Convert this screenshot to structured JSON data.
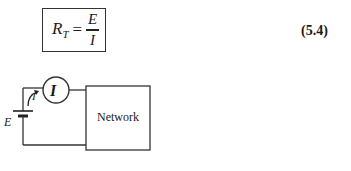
{
  "equation": {
    "lhs_symbol": "R",
    "lhs_subscript": "T",
    "equals": "=",
    "numerator": "E",
    "denominator": "I",
    "number": "(5.4)"
  },
  "circuit": {
    "source_label": "E",
    "current_label": "I",
    "ammeter_label": "I",
    "network_label": "Network",
    "line_color": "#333333"
  }
}
